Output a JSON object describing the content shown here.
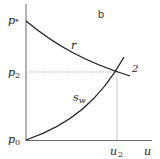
{
  "figure": {
    "panel_label": "b",
    "y_axis": {
      "ticks": [
        {
          "label": "p*",
          "main": "p",
          "sub": "*"
        },
        {
          "label": "p2",
          "main": "p",
          "sub": "2"
        },
        {
          "label": "p0",
          "main": "p",
          "sub": "0"
        }
      ]
    },
    "x_axis": {
      "label": "u",
      "ticks": [
        {
          "label": "u2",
          "main": "u",
          "sub": "2"
        }
      ]
    },
    "curves": [
      {
        "name": "r",
        "label_main": "r",
        "label_sub": "",
        "description": "decreasing concave-up curve from p* to beyond point 2"
      },
      {
        "name": "s_w",
        "label_main": "s",
        "label_sub": "w",
        "description": "increasing convex curve from p0 through point 2"
      }
    ],
    "intersection": {
      "label": "2",
      "x": "u2",
      "y": "p2"
    },
    "colors": {
      "axis": "#666666",
      "curve": "#222222",
      "guide": "#999999"
    }
  }
}
